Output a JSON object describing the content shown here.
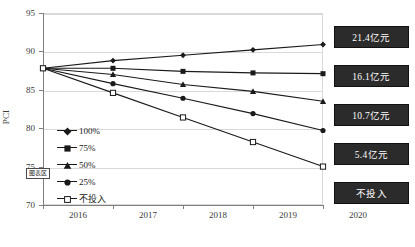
{
  "chart_data": {
    "type": "line",
    "title": "",
    "xlabel": "",
    "ylabel": "PCI",
    "x": [
      "2016",
      "2017",
      "2018",
      "2019",
      "2020"
    ],
    "ylim": [
      70,
      95
    ],
    "ytick_labels": [
      "70",
      "75",
      "80",
      "85",
      "90",
      "95"
    ],
    "yticks": [
      70,
      75,
      80,
      85,
      90,
      95
    ],
    "grid": true,
    "legend_position": "inside-left",
    "series": [
      {
        "name": "100%",
        "marker": "diamond",
        "values": [
          87.8,
          88.8,
          89.5,
          90.2,
          90.9
        ]
      },
      {
        "name": "75%",
        "marker": "square",
        "values": [
          87.8,
          87.8,
          87.4,
          87.2,
          87.1
        ]
      },
      {
        "name": "50%",
        "marker": "triangle",
        "values": [
          87.8,
          87.0,
          85.7,
          84.8,
          83.5
        ]
      },
      {
        "name": "25%",
        "marker": "circle",
        "values": [
          87.8,
          85.8,
          83.9,
          81.9,
          79.7
        ]
      },
      {
        "name": "不投入",
        "marker": "open-square",
        "values": [
          87.8,
          84.6,
          81.4,
          78.2,
          75.0
        ]
      }
    ]
  },
  "axes": {
    "y_title": "PCI",
    "y_ticks": [
      "95",
      "90",
      "85",
      "80",
      "75",
      "70"
    ],
    "x_ticks": [
      "2016",
      "2017",
      "2018",
      "2019",
      "2020"
    ]
  },
  "legend": {
    "items": [
      {
        "label": "100%",
        "marker": "diamond"
      },
      {
        "label": "75%",
        "marker": "square"
      },
      {
        "label": "50%",
        "marker": "triangle"
      },
      {
        "label": "25%",
        "marker": "circle"
      },
      {
        "label": "不投入",
        "marker": "open-square"
      }
    ]
  },
  "value_boxes": [
    {
      "label": "21.4亿元"
    },
    {
      "label": "16.1亿元"
    },
    {
      "label": "10.7亿元"
    },
    {
      "label": "5.4亿元"
    },
    {
      "label": "不投入"
    }
  ],
  "tooltip": {
    "text": "图表区"
  },
  "caption": {
    "text": ""
  },
  "colors": {
    "series_line": "#1a1a1a",
    "gridline": "#d9d9d9",
    "axis": "#7f7f7f",
    "box_background": "#2b2b2b",
    "box_text": "#ffffff"
  }
}
